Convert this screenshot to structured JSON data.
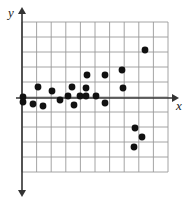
{
  "figure": {
    "type": "scatter-plot-graphic",
    "background_color": "#ffffff",
    "grid_color": "#9a9a9a",
    "axis_color": "#333333",
    "point_color": "#111111"
  },
  "axes": {
    "x_label": "x",
    "y_label": "y",
    "x_axis_name": "x-axis",
    "y_axis_name": "y-axis",
    "x_arrow": "arrow-right",
    "y_arrow_up": "arrow-up",
    "y_arrow_down": "arrow-down"
  },
  "grid": {
    "left": 22,
    "top": 22,
    "right": 168,
    "bottom": 172,
    "columns": 10,
    "rows": 10,
    "cell_width": 14.6,
    "cell_height": 15.0,
    "show_grid": true
  },
  "chart_data": {
    "type": "scatter",
    "title": "",
    "xlabel": "x",
    "ylabel": "y",
    "grid": true,
    "legend": null,
    "xlim": [
      0,
      10
    ],
    "ylim": [
      -5,
      5
    ],
    "origin_px": {
      "x": 22,
      "y": 98
    },
    "point_radius_px": 3.4,
    "points_px": [
      {
        "x": 23,
        "y": 97
      },
      {
        "x": 23,
        "y": 102
      },
      {
        "x": 33,
        "y": 104
      },
      {
        "x": 38,
        "y": 87
      },
      {
        "x": 43,
        "y": 106
      },
      {
        "x": 52,
        "y": 91
      },
      {
        "x": 60,
        "y": 100
      },
      {
        "x": 68,
        "y": 96
      },
      {
        "x": 72,
        "y": 87
      },
      {
        "x": 74,
        "y": 105
      },
      {
        "x": 80,
        "y": 96
      },
      {
        "x": 86,
        "y": 96
      },
      {
        "x": 86,
        "y": 88
      },
      {
        "x": 87,
        "y": 75
      },
      {
        "x": 96,
        "y": 96
      },
      {
        "x": 105,
        "y": 75
      },
      {
        "x": 105,
        "y": 103
      },
      {
        "x": 122,
        "y": 70
      },
      {
        "x": 123,
        "y": 88
      },
      {
        "x": 135,
        "y": 128
      },
      {
        "x": 142,
        "y": 137
      },
      {
        "x": 134,
        "y": 147
      },
      {
        "x": 145,
        "y": 50
      }
    ],
    "points_data": [
      {
        "x": 0.0,
        "y": 0.1
      },
      {
        "x": 0.1,
        "y": -0.3
      },
      {
        "x": 0.8,
        "y": -0.4
      },
      {
        "x": 1.1,
        "y": 0.7
      },
      {
        "x": 1.4,
        "y": -0.5
      },
      {
        "x": 2.1,
        "y": 0.5
      },
      {
        "x": 2.6,
        "y": -0.1
      },
      {
        "x": 3.2,
        "y": 0.1
      },
      {
        "x": 3.4,
        "y": 0.7
      },
      {
        "x": 3.6,
        "y": -0.5
      },
      {
        "x": 4.0,
        "y": 0.1
      },
      {
        "x": 4.4,
        "y": 0.1
      },
      {
        "x": 4.4,
        "y": 0.7
      },
      {
        "x": 4.5,
        "y": 1.5
      },
      {
        "x": 5.1,
        "y": 0.1
      },
      {
        "x": 5.7,
        "y": 1.5
      },
      {
        "x": 5.7,
        "y": -0.3
      },
      {
        "x": 6.8,
        "y": 1.9
      },
      {
        "x": 6.9,
        "y": 0.7
      },
      {
        "x": 7.7,
        "y": -2.0
      },
      {
        "x": 8.2,
        "y": -2.6
      },
      {
        "x": 7.7,
        "y": -3.3
      },
      {
        "x": 8.4,
        "y": 3.2
      }
    ]
  }
}
